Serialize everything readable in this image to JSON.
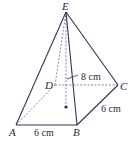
{
  "figure": {
    "type": "square-based pyramid",
    "vertices": {
      "A": {
        "label": "A",
        "x": 16,
        "y": 125
      },
      "B": {
        "label": "B",
        "x": 77,
        "y": 125
      },
      "C": {
        "label": "C",
        "x": 118,
        "y": 85
      },
      "D": {
        "label": "D",
        "x": 55,
        "y": 85
      },
      "E": {
        "label": "E",
        "x": 66,
        "y": 12
      }
    },
    "center_point": {
      "x": 66,
      "y": 107
    },
    "dimensions": {
      "height_label": "8 cm",
      "ab_label": "6 cm",
      "bc_label": "6 cm"
    },
    "colors": {
      "edge": "#35325a",
      "hidden_edge": "#6b6a80",
      "text": "#2a2a35",
      "background": "#ffffff"
    }
  }
}
